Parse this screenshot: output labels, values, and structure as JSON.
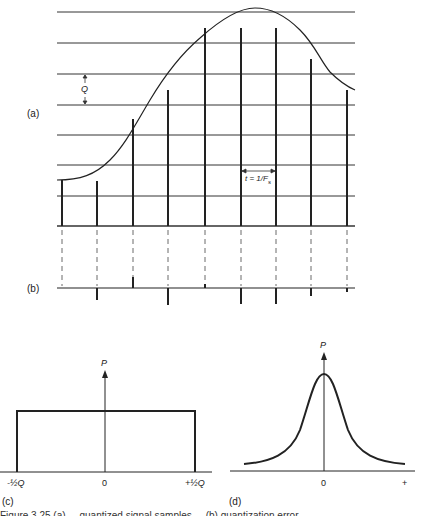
{
  "panels": {
    "a": {
      "label": "(a)",
      "quantization_step_label": "Q",
      "sample_interval_label": "t = 1/F",
      "sample_interval_subscript": "s",
      "quantization_levels_y": [
        12,
        43,
        74,
        105,
        135,
        165,
        196,
        226
      ],
      "sample_x": [
        62,
        97,
        133,
        168,
        205,
        241,
        276,
        311,
        347
      ],
      "sample_top_y": [
        180,
        181,
        119,
        90,
        28,
        28,
        28,
        59,
        90
      ]
    },
    "b": {
      "label": "(b)",
      "baseline_y": 288,
      "error_end_y": [
        288,
        300,
        277,
        305,
        284,
        304,
        304,
        296,
        292
      ]
    },
    "c": {
      "label": "(c)",
      "axis_label": "P",
      "ticks": [
        "-½Q",
        "0",
        "+½Q"
      ]
    },
    "d": {
      "label": "(d)",
      "axis_label": "P",
      "ticks": [
        "0",
        "+"
      ]
    }
  },
  "caption": "Figure 3.25 (a) ... quantized signal samples ... (b) quantization error ..."
}
